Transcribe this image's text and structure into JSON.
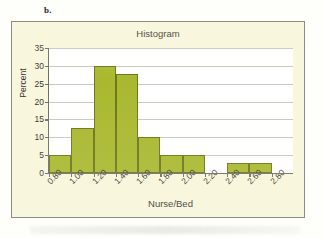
{
  "panel": {
    "label": "b."
  },
  "colors": {
    "bar_fill": "#a9b82f",
    "bar_stroke": "#6d7520",
    "panel_bg": "#f8f7dd",
    "plot_bg": "#ffffff",
    "frame_border": "#8c8c84",
    "grid": "#c9c9c2",
    "axis": "#6f6f68",
    "text": "#35332f"
  },
  "chart_data": {
    "type": "bar",
    "title": "Histogram",
    "xlabel": "Nurse/Bed",
    "ylabel": "Percent",
    "grid": true,
    "legend": "none",
    "ylim": [
      0,
      35
    ],
    "yticks": [
      0,
      5,
      10,
      15,
      20,
      25,
      30,
      35
    ],
    "xticks": [
      "0.80",
      "1.00",
      "1.20",
      "1.40",
      "1.60",
      "1.80",
      "2.00",
      "2.20",
      "2.40",
      "2.60",
      "2.80"
    ],
    "bin_edges": [
      0.8,
      1.0,
      1.2,
      1.4,
      1.6,
      1.8,
      2.0,
      2.2,
      2.4,
      2.6,
      2.8
    ],
    "bin_labels": [
      "0.80-1.00",
      "1.00-1.20",
      "1.20-1.40",
      "1.40-1.60",
      "1.60-1.80",
      "1.80-2.00",
      "2.00-2.20",
      "2.20-2.40",
      "2.40-2.60",
      "2.60-2.80"
    ],
    "values": [
      5.0,
      12.5,
      30.0,
      27.7,
      10.0,
      5.0,
      5.0,
      0.0,
      2.7,
      2.7
    ]
  }
}
